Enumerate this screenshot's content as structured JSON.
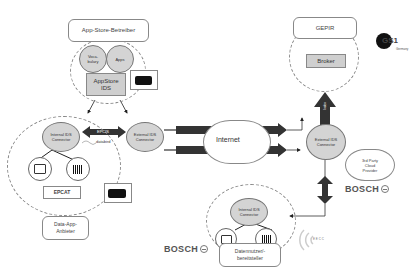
{
  "app_store": {
    "title": "App-Store-Betreiber",
    "vocabulary": "Voca-\nbulary",
    "apps": "Apps",
    "appstore_ids": "AppStore\nIDS"
  },
  "gepir": {
    "title": "GEPIR",
    "broker": "Broker",
    "logo_text": "GS1",
    "logo_sub": "Germany"
  },
  "data_app": {
    "internal_connector": "Internal IDS\nConnector",
    "external_connector": "External IDS\nConnector",
    "epcis_arrow": "EPCIS",
    "databird": "databird",
    "epcat": "EPCAT",
    "title": "Data-App-\nAnbieter"
  },
  "internet": {
    "cloud_label": "Internet",
    "index_arrow": "Index",
    "eecc_arrow": "EECC EPCIS"
  },
  "right_connector": {
    "label": "External IDS\nConnector",
    "index_up": "Index",
    "third_party": "3rd Party\nCloud\nProvider",
    "bosch": "BOSCH"
  },
  "data_user": {
    "internal_connector": "Internal IDS\nConnector",
    "title": "Datennutzer/-\nbereitsteller",
    "bosch": "BOSCH",
    "eecc_logo": "E E C C"
  }
}
